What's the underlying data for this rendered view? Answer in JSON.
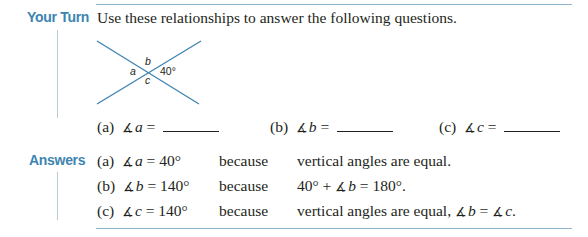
{
  "section": {
    "your_turn_label": "Your Turn",
    "answers_label": "Answers",
    "intro_text": "Use these relationships to answer the following questions."
  },
  "diagram": {
    "labels": {
      "a": "a",
      "b": "b",
      "c": "c",
      "given": "40°"
    },
    "line_color": "#3d84b0"
  },
  "questions": [
    {
      "part": "(a)",
      "angle_symbol": "∡",
      "var": "a",
      "equals": "="
    },
    {
      "part": "(b)",
      "angle_symbol": "∡",
      "var": "b",
      "equals": "="
    },
    {
      "part": "(c)",
      "angle_symbol": "∡",
      "var": "c",
      "equals": "="
    }
  ],
  "answers": [
    {
      "part": "(a)",
      "angle_symbol": "∡",
      "var": "a",
      "value": "= 40°",
      "because": "because",
      "reason": "vertical angles are equal."
    },
    {
      "part": "(b)",
      "angle_symbol": "∡",
      "var": "b",
      "value": "= 140°",
      "because": "because",
      "reason_pre": "40° + ",
      "reason_sym": "∡",
      "reason_var": "b",
      "reason_post": " = 180°."
    },
    {
      "part": "(c)",
      "angle_symbol": "∡",
      "var": "c",
      "value": "= 140°",
      "because": "because",
      "reason_pre": "vertical angles are equal, ",
      "reason_sym1": "∡",
      "reason_var1": "b",
      "reason_mid": " = ",
      "reason_sym2": "∡",
      "reason_var2": "c",
      "reason_post": "."
    }
  ],
  "colors": {
    "accent": "#3d84b0",
    "rule": "#8fb5cc",
    "text": "#231f20"
  }
}
